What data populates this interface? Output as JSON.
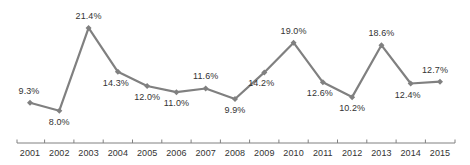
{
  "chart_data": {
    "type": "line",
    "title": "",
    "subtitle": "",
    "xlabel": "",
    "ylabel": "",
    "grid": false,
    "legend": "none",
    "categories": [
      "2001",
      "2002",
      "2003",
      "2004",
      "2005",
      "2006",
      "2007",
      "2008",
      "2009",
      "2010",
      "2011",
      "2012",
      "2013",
      "2014",
      "2015"
    ],
    "values": [
      9.3,
      8.0,
      21.4,
      14.3,
      12.0,
      11.0,
      11.6,
      9.9,
      14.2,
      19.0,
      12.6,
      10.2,
      18.6,
      12.4,
      12.7
    ],
    "data_labels": [
      "9.3%",
      "8.0%",
      "21.4%",
      "14.3%",
      "12.0%",
      "11.0%",
      "11.6%",
      "9.9%",
      "14.2%",
      "19.0%",
      "12.6%",
      "10.2%",
      "18.6%",
      "12.4%",
      "12.7%"
    ],
    "label_positions": [
      "above",
      "below",
      "above",
      "below",
      "below",
      "below",
      "above",
      "below",
      "below",
      "above",
      "below",
      "below",
      "above",
      "below",
      "above"
    ],
    "ylim": [
      6.5,
      23.0
    ],
    "series": [
      {
        "name": "series-1",
        "values": [
          9.3,
          8.0,
          21.4,
          14.3,
          12.0,
          11.0,
          11.6,
          9.9,
          14.2,
          19.0,
          12.6,
          10.2,
          18.6,
          12.4,
          12.7
        ],
        "color": "#808080"
      }
    ],
    "axis": {
      "line_color": "#808080",
      "tick_color": "#808080",
      "tick_labels": [
        "2001",
        "2002",
        "2003",
        "2004",
        "2005",
        "2006",
        "2007",
        "2008",
        "2009",
        "2010",
        "2011",
        "2012",
        "2013",
        "2014",
        "2015"
      ]
    },
    "marker": {
      "shape": "diamond",
      "color": "#808080"
    },
    "colors": {
      "line": "#808080",
      "marker": "#808080",
      "text": "#333333",
      "axis": "#808080",
      "background": "#ffffff"
    }
  }
}
